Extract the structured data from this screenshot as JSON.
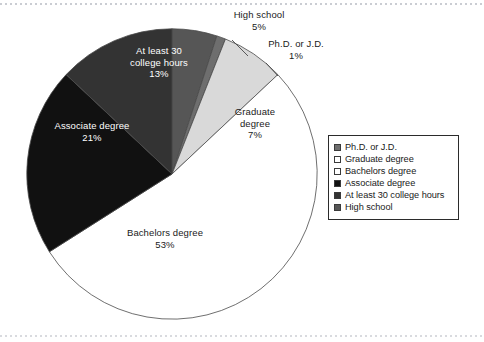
{
  "chart_data": {
    "type": "pie",
    "title": "",
    "subtitle": "",
    "xlabel": "",
    "ylabel": "",
    "grid": false,
    "legend_position": "right",
    "units": "percent",
    "categories": [
      "Ph.D. or J.D.",
      "Graduate degree",
      "Bachelors degree",
      "Associate degree",
      "At least 30 college hours",
      "High school"
    ],
    "values": [
      1,
      7,
      53,
      21,
      13,
      5
    ],
    "colors": [
      "#6e6e6e",
      "#d9d9d9",
      "#ffffff",
      "#111111",
      "#333333",
      "#565656"
    ],
    "slices": [
      {
        "label": "Ph.D. or J.D.",
        "value": 1,
        "value_text": "1%",
        "color": "#6e6e6e",
        "swatch": "#6e6e6e",
        "label_placement": "outside",
        "text_color": "dark"
      },
      {
        "label": "Graduate degree",
        "value": 7,
        "value_text": "7%",
        "color": "#d9d9d9",
        "swatch": "#ffffff",
        "label_placement": "inside",
        "text_color": "dark"
      },
      {
        "label": "Bachelors degree",
        "value": 53,
        "value_text": "53%",
        "color": "#ffffff",
        "swatch": "#ffffff",
        "label_placement": "inside",
        "text_color": "dark"
      },
      {
        "label": "Associate degree",
        "value": 21,
        "value_text": "21%",
        "color": "#111111",
        "swatch": "#111111",
        "label_placement": "inside",
        "text_color": "light"
      },
      {
        "label": "At least 30 college hours",
        "value": 13,
        "value_text": "13%",
        "color": "#333333",
        "swatch": "#333333",
        "label_placement": "inside",
        "text_color": "light"
      },
      {
        "label": "High school",
        "value": 5,
        "value_text": "5%",
        "color": "#565656",
        "swatch": "#565656",
        "label_placement": "outside",
        "text_color": "dark"
      }
    ]
  },
  "labels": {
    "at30": {
      "line1": "At least 30",
      "line2": "college hours",
      "pct": "13%"
    },
    "associate": {
      "line1": "Associate degree",
      "pct": "21%"
    },
    "bachelors": {
      "line1": "Bachelors degree",
      "pct": "53%"
    },
    "graduate": {
      "line1": "Graduate",
      "line2": "degree",
      "pct": "7%"
    },
    "highschool": {
      "line1": "High school",
      "pct": "5%"
    },
    "phd": {
      "line1": "Ph.D. or J.D.",
      "pct": "1%"
    }
  },
  "legend": {
    "items": [
      {
        "label": "Ph.D. or J.D.",
        "swatch": "#6e6e6e"
      },
      {
        "label": "Graduate degree",
        "swatch": "#ffffff"
      },
      {
        "label": "Bachelors degree",
        "swatch": "#ffffff"
      },
      {
        "label": "Associate degree",
        "swatch": "#111111"
      },
      {
        "label": "At least 30 college hours",
        "swatch": "#333333"
      },
      {
        "label": "High school",
        "swatch": "#565656"
      }
    ]
  }
}
